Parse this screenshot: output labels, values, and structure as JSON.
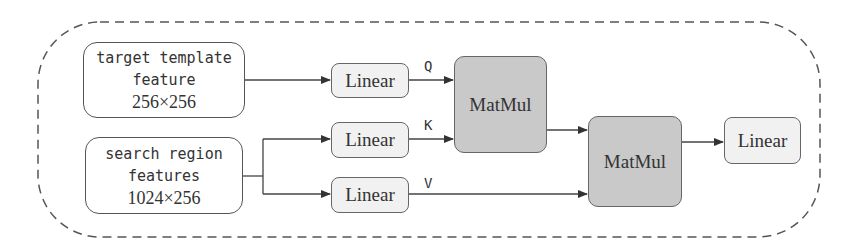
{
  "diagram": {
    "inputs": {
      "template": {
        "line1": "target template",
        "line2": "feature",
        "line3": "256×256"
      },
      "search": {
        "line1": "search region",
        "line2": "features",
        "line3": "1024×256"
      }
    },
    "nodes": {
      "linear_q": "Linear",
      "linear_k": "Linear",
      "linear_v": "Linear",
      "matmul_1": "MatMul",
      "matmul_2": "MatMul",
      "linear_out": "Linear"
    },
    "edge_labels": {
      "q": "Q",
      "k": "K",
      "v": "V"
    },
    "colors": {
      "matmul_fill": "#c9c9c9",
      "linear_fill": "#f1f1f1",
      "stroke": "#555555"
    }
  }
}
